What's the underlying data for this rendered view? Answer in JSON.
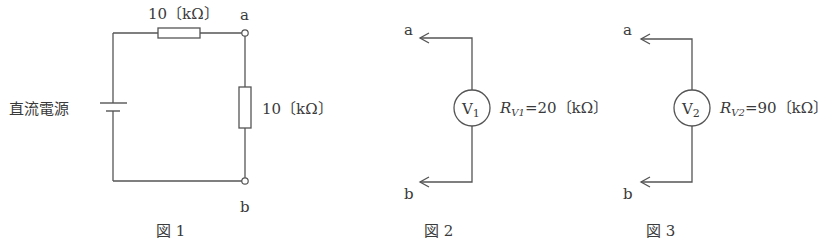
{
  "figures": [
    {
      "id": "fig1",
      "caption": "図 1",
      "source_label": "直流電源",
      "resistor_top_label": "10〔kΩ〕",
      "resistor_right_label": "10〔kΩ〕",
      "terminal_a": "a",
      "terminal_b": "b"
    },
    {
      "id": "fig2",
      "caption": "図 2",
      "meter_symbol": "V",
      "meter_subscript": "1",
      "resistance_symbol": "R",
      "resistance_subscript": "V1",
      "resistance_value": "=20〔kΩ〕",
      "terminal_a": "a",
      "terminal_b": "b"
    },
    {
      "id": "fig3",
      "caption": "図 3",
      "meter_symbol": "V",
      "meter_subscript": "2",
      "resistance_symbol": "R",
      "resistance_subscript": "V2",
      "resistance_value": "=90〔kΩ〕",
      "terminal_a": "a",
      "terminal_b": "b"
    }
  ],
  "colors": {
    "line": "#555555",
    "text": "#3a3a3a",
    "background": "#ffffff"
  }
}
